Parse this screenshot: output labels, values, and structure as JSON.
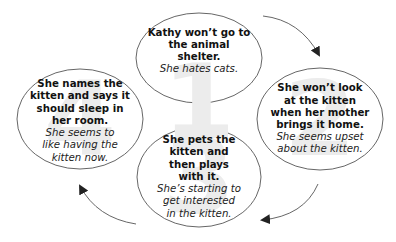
{
  "diagram": {
    "type": "cycle",
    "colors": {
      "ellipse_stroke": "#555555",
      "arrow": "#555555",
      "numeral": "#ececec",
      "text": "#111111"
    },
    "nodes": [
      {
        "number": "1",
        "event": "Kathy won’t go to the animal shelter.",
        "feeling": "She hates cats."
      },
      {
        "number": "2",
        "event": "She won’t look at the kitten when her mother brings it home.",
        "feeling": "She seems upset about the kitten."
      },
      {
        "number": "3",
        "event": "She pets the kitten and then plays with it.",
        "feeling": "She’s starting to get interested in the kitten."
      },
      {
        "number": "4",
        "event": "She names the kitten and says it should sleep in her room.",
        "feeling": "She seems to like having the kitten now."
      }
    ],
    "arrows": [
      {
        "from": "1",
        "to": "2"
      },
      {
        "from": "2",
        "to": "3"
      },
      {
        "from": "3",
        "to": "4"
      }
    ]
  }
}
